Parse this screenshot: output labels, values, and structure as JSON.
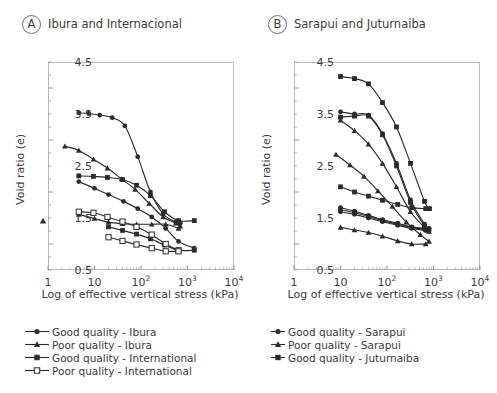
{
  "figure": {
    "ylabel": "Void ratio (e)",
    "xlabel": "Log of effective vertical stress (kPa)",
    "yticks": [
      "4.5",
      "3.5",
      "2.5",
      "1.5",
      "0.5"
    ],
    "xticks": [
      "1",
      "10",
      "10",
      "10",
      "10"
    ],
    "xtick_exponents": [
      "",
      "",
      "2",
      "3",
      "4"
    ]
  },
  "panels": [
    {
      "badge": "A",
      "title": "Ibura and Internacional",
      "legend": [
        {
          "label": "Good quality - Ibura",
          "marker": "filled-circle"
        },
        {
          "label": "Poor quality - Ibura",
          "marker": "filled-triangle"
        },
        {
          "label": "Good quality - International",
          "marker": "filled-square"
        },
        {
          "label": "Poor quality - International",
          "marker": "open-square"
        }
      ]
    },
    {
      "badge": "B",
      "title": "Sarapui and Juturnaiba",
      "legend": [
        {
          "label": "Good quality - Sarapui",
          "marker": "filled-circle"
        },
        {
          "label": "Poor quality - Sarapui",
          "marker": "filled-triangle"
        },
        {
          "label": "Good quality - Juturnaiba",
          "marker": "filled-square"
        }
      ]
    }
  ],
  "chart_data": [
    {
      "type": "line",
      "panel": "A",
      "title": "Ibura and Internacional",
      "xlabel": "Log of effective vertical stress (kPa)",
      "ylabel": "Void ratio (e)",
      "xlim": [
        1,
        10000
      ],
      "ylim": [
        0.5,
        4.5
      ],
      "xscale": "log",
      "grid": false,
      "legend_position": "below-axes",
      "series": [
        {
          "name": "Good quality - Ibura",
          "marker": "filled-circle",
          "x": [
            4.6,
            7.5,
            13,
            24,
            45,
            85,
            160,
            300,
            560,
            700
          ],
          "y": [
            3.52,
            3.51,
            3.48,
            3.43,
            3.27,
            2.68,
            2.0,
            1.58,
            1.42,
            1.4
          ]
        },
        {
          "name": "Poor quality - Ibura",
          "marker": "filled-triangle",
          "x": [
            2.3,
            4.6,
            9.5,
            19,
            38,
            75,
            150,
            300,
            560,
            700
          ],
          "y": [
            2.88,
            2.8,
            2.63,
            2.46,
            2.25,
            2.05,
            1.78,
            1.52,
            1.4,
            1.34
          ]
        },
        {
          "name": "Good quality - Ibura (2)",
          "marker": "filled-circle",
          "x": [
            4.6,
            10,
            20,
            42,
            85,
            170,
            340,
            640,
            1400
          ],
          "y": [
            2.2,
            2.07,
            1.95,
            1.82,
            1.68,
            1.52,
            1.3,
            1.05,
            0.92
          ]
        },
        {
          "name": "Poor quality - Ibura (2)",
          "marker": "filled-triangle",
          "x": [
            4.6,
            10,
            20,
            40,
            80,
            170,
            340,
            640
          ],
          "y": [
            1.57,
            1.49,
            1.42,
            1.39,
            1.38,
            1.38,
            1.38,
            1.3
          ]
        },
        {
          "name": "Good quality - International",
          "marker": "filled-square",
          "x": [
            4.6,
            9.5,
            19,
            40,
            80,
            160,
            320,
            640,
            1400
          ],
          "y": [
            2.31,
            2.3,
            2.28,
            2.24,
            2.13,
            1.93,
            1.62,
            1.45,
            1.45
          ]
        },
        {
          "name": "Good quality - International (2)",
          "marker": "filled-square",
          "x": [
            20,
            40,
            80,
            160,
            320,
            640,
            1400
          ],
          "y": [
            1.33,
            1.26,
            1.19,
            1.1,
            0.98,
            0.88,
            0.88
          ]
        },
        {
          "name": "Poor quality - International",
          "marker": "open-square",
          "x": [
            4.6,
            9.5,
            19,
            40,
            80,
            170,
            340,
            640
          ],
          "y": [
            1.62,
            1.6,
            1.52,
            1.43,
            1.33,
            1.18,
            1.0,
            0.88
          ]
        },
        {
          "name": "Poor quality - International (2)",
          "marker": "open-square",
          "x": [
            20,
            40,
            80,
            170,
            340,
            640
          ],
          "y": [
            1.13,
            1.06,
            0.99,
            0.92,
            0.86,
            0.86
          ]
        }
      ]
    },
    {
      "type": "line",
      "panel": "B",
      "title": "Sarapui and Juturnaiba",
      "xlabel": "Log of effective vertical stress (kPa)",
      "ylabel": "Void ratio (e)",
      "xlim": [
        1,
        10000
      ],
      "ylim": [
        0.5,
        4.5
      ],
      "xscale": "log",
      "grid": false,
      "legend_position": "below-axes",
      "series": [
        {
          "name": "Good quality - Juturnaiba",
          "marker": "filled-square",
          "x": [
            10,
            20,
            40,
            80,
            160,
            320,
            640,
            820
          ],
          "y": [
            4.22,
            4.18,
            4.08,
            3.72,
            3.25,
            2.55,
            1.82,
            1.68
          ]
        },
        {
          "name": "Good quality - Sarapui",
          "marker": "filled-circle",
          "x": [
            10,
            20,
            40,
            80,
            160,
            320,
            640,
            800
          ],
          "y": [
            3.54,
            3.5,
            3.48,
            3.12,
            2.55,
            1.85,
            1.38,
            1.3
          ]
        },
        {
          "name": "Good quality - Juturnaiba (2)",
          "marker": "filled-square",
          "x": [
            10,
            20,
            40,
            80,
            160,
            320,
            640,
            800
          ],
          "y": [
            3.44,
            3.46,
            3.46,
            3.1,
            2.5,
            1.8,
            1.35,
            1.28
          ]
        },
        {
          "name": "Poor quality - Sarapui",
          "marker": "filled-triangle",
          "x": [
            10,
            20,
            40,
            80,
            160,
            320,
            640,
            800
          ],
          "y": [
            3.38,
            3.18,
            2.92,
            2.55,
            2.1,
            1.62,
            1.32,
            1.24
          ]
        },
        {
          "name": "Poor quality - Sarapui (2)",
          "marker": "filled-triangle",
          "x": [
            8,
            16,
            32,
            64,
            130,
            260,
            520,
            800
          ],
          "y": [
            2.72,
            2.52,
            2.3,
            2.02,
            1.72,
            1.42,
            1.18,
            1.05
          ]
        },
        {
          "name": "Good quality - Juturnaiba (3)",
          "marker": "filled-square",
          "x": [
            10,
            20,
            40,
            80,
            170,
            340,
            680
          ],
          "y": [
            2.1,
            2.0,
            1.92,
            1.84,
            1.76,
            1.7,
            1.68
          ]
        },
        {
          "name": "Good quality - Sarapui (2)",
          "marker": "filled-circle",
          "x": [
            10,
            20,
            40,
            80,
            170,
            340,
            680
          ],
          "y": [
            1.7,
            1.63,
            1.55,
            1.47,
            1.4,
            1.33,
            1.3
          ]
        },
        {
          "name": "Good quality - Juturnaiba (4)",
          "marker": "filled-square",
          "x": [
            10,
            20,
            40,
            80,
            170,
            340,
            680
          ],
          "y": [
            1.66,
            1.6,
            1.53,
            1.45,
            1.38,
            1.32,
            1.28
          ]
        },
        {
          "name": "Good quality - Sarapui (3)",
          "marker": "filled-circle",
          "x": [
            10,
            20,
            40,
            80,
            170,
            340,
            680
          ],
          "y": [
            1.62,
            1.57,
            1.5,
            1.43,
            1.36,
            1.3,
            1.26
          ]
        },
        {
          "name": "Poor quality - Sarapui (3)",
          "marker": "filled-triangle",
          "x": [
            10,
            20,
            40,
            80,
            170,
            340,
            680
          ],
          "y": [
            1.32,
            1.27,
            1.22,
            1.15,
            1.06,
            1.0,
            1.0
          ]
        }
      ]
    }
  ]
}
